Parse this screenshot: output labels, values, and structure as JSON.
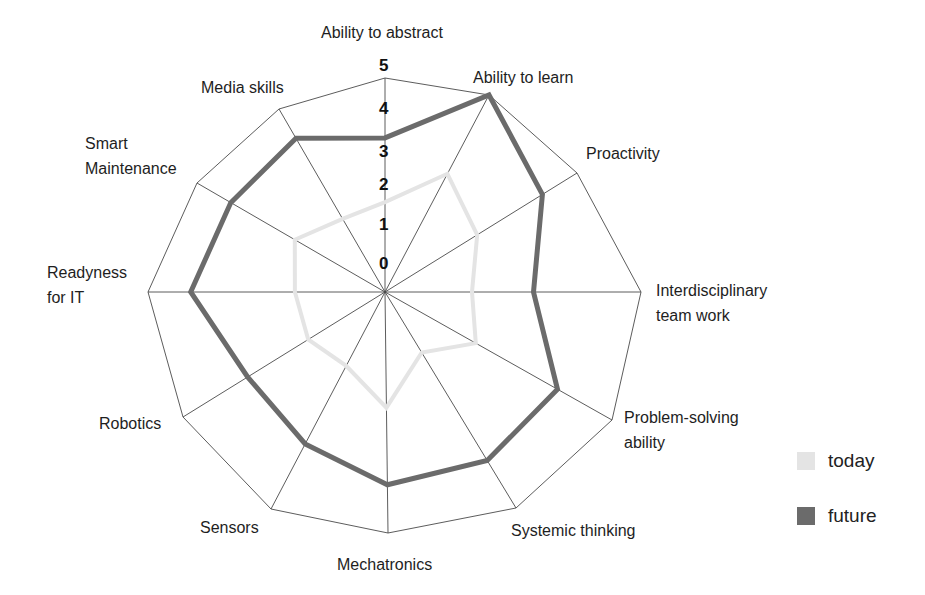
{
  "chart_data": {
    "type": "radar",
    "title": "",
    "axes": [
      "Ability to abstract",
      "Ability to learn",
      "Proactivity",
      "Interdisciplinary team work",
      "Problem-solving ability",
      "Systemic thinking",
      "Mechatronics",
      "Sensors",
      "Robotics",
      "Readyness for IT",
      "Smart Maintenance",
      "Media skills"
    ],
    "axis_label_lines": [
      [
        "Ability to abstract"
      ],
      [
        "Ability to learn"
      ],
      [
        "Proactivity"
      ],
      [
        "Interdisciplinary",
        "team work"
      ],
      [
        "Problem-solving",
        "ability"
      ],
      [
        "Systemic thinking"
      ],
      [
        "Mechatronics"
      ],
      [
        "Sensors"
      ],
      [
        "Robotics"
      ],
      [
        "Readyness",
        "for IT"
      ],
      [
        "Smart",
        "Maintenance"
      ],
      [
        "Media skills"
      ]
    ],
    "scale": {
      "min": 0,
      "max": 5,
      "ticks": [
        "0",
        "1",
        "2",
        "3",
        "4",
        "5"
      ]
    },
    "grid": "outer ring and spokes only",
    "series": [
      {
        "name": "today",
        "color": "#e4e4e4",
        "values": [
          2.1,
          3.0,
          2.4,
          1.7,
          2.0,
          1.4,
          2.4,
          1.7,
          1.9,
          1.9,
          2.4,
          2.0
        ]
      },
      {
        "name": "future",
        "color": "#6b6b6b",
        "values": [
          3.6,
          5.0,
          4.1,
          2.9,
          3.8,
          3.9,
          4.0,
          3.5,
          3.4,
          4.1,
          4.1,
          4.2
        ]
      }
    ],
    "legend": {
      "position": "right-bottom",
      "entries": [
        "today",
        "future"
      ]
    }
  }
}
